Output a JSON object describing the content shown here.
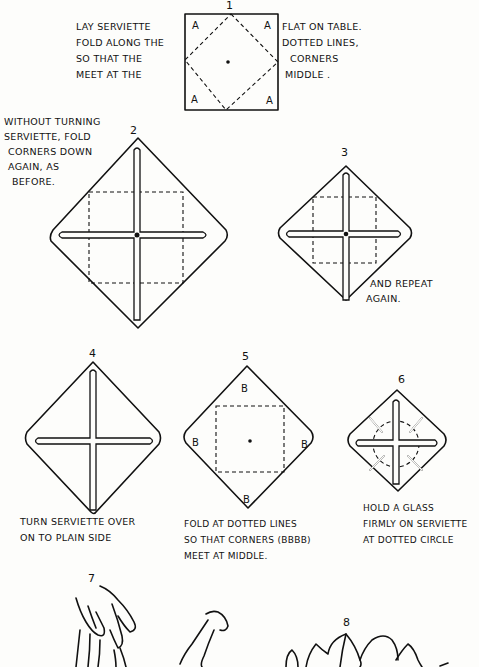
{
  "steps": [
    {
      "number": "1",
      "lines": [
        "LAY SERVIETTE",
        "FOLD ALONG THE",
        "SO THAT THE",
        "MEET AT THE"
      ],
      "lines_right": [
        "FLAT ON TABLE.",
        "DOTTED LINES,",
        "CORNERS",
        "MIDDLE ."
      ],
      "corner_labels": [
        "A",
        "A",
        "A",
        "A"
      ]
    },
    {
      "number": "2",
      "lines": [
        "WITHOUT TURNING",
        "SERVIETTE, FOLD",
        "CORNERS DOWN",
        "AGAIN, AS",
        "BEFORE."
      ]
    },
    {
      "number": "3",
      "lines": [
        "AND REPEAT",
        "AGAIN."
      ]
    },
    {
      "number": "4",
      "lines": [
        "TURN SERVIETTE OVER",
        "ON TO PLAIN SIDE"
      ]
    },
    {
      "number": "5",
      "lines": [
        "FOLD AT DOTTED LINES",
        "SO THAT CORNERS (BBBB)",
        "MEET AT MIDDLE."
      ],
      "corner_labels": [
        "B",
        "B",
        "B",
        "B"
      ]
    },
    {
      "number": "6",
      "lines": [
        "HOLD A GLASS",
        "FIRMLY ON SERVIETTE",
        "AT DOTTED CIRCLE"
      ]
    },
    {
      "number": "7"
    },
    {
      "number": "8"
    }
  ],
  "colors": {
    "ink": "#111111",
    "paper": "#fdfdfb"
  }
}
